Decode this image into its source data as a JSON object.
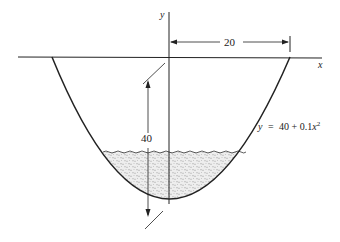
{
  "diagram": {
    "axes": {
      "x_label": "x",
      "y_label": "y"
    },
    "dimensions": {
      "half_width": "20",
      "depth": "40"
    },
    "equation": {
      "lhs": "y",
      "eq": "=",
      "rhs_const": "40 + 0.1",
      "rhs_var": "x",
      "rhs_exp": "2"
    },
    "colors": {
      "line": "#222222",
      "water_fill": "#e6e6e6",
      "water_speck": "#9a9a9a"
    }
  }
}
